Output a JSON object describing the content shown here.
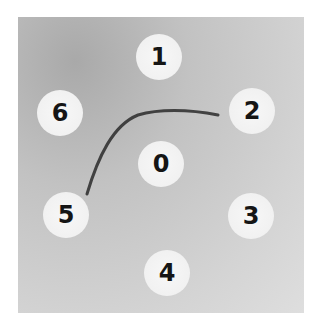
{
  "figure": {
    "wells": [
      {
        "label": "1",
        "x": 159,
        "y": 57
      },
      {
        "label": "2",
        "x": 252,
        "y": 111
      },
      {
        "label": "3",
        "x": 251,
        "y": 216
      },
      {
        "label": "4",
        "x": 167,
        "y": 273
      },
      {
        "label": "5",
        "x": 66,
        "y": 215
      },
      {
        "label": "6",
        "x": 60,
        "y": 113
      },
      {
        "label": "0",
        "x": 161,
        "y": 164
      }
    ],
    "colors": {
      "background": "#c8c8c8",
      "well": "#f3f3f3",
      "precipitin_line": "#2a2a2a",
      "label": "#151515"
    }
  }
}
